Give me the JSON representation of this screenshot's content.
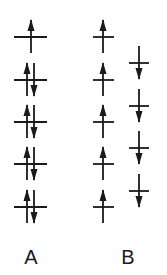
{
  "diagram": {
    "type": "electron-spin-configuration",
    "colors": {
      "line": "#1a1a1a",
      "background": "#ffffff"
    },
    "configurations": [
      {
        "label": "A",
        "description": "paired spins (low spin)",
        "levels": [
          {
            "y": 37,
            "electrons": [
              "up"
            ]
          },
          {
            "y": 80,
            "electrons": [
              "up",
              "down"
            ]
          },
          {
            "y": 122,
            "electrons": [
              "up",
              "down"
            ]
          },
          {
            "y": 164,
            "electrons": [
              "up",
              "down"
            ]
          },
          {
            "y": 207,
            "electrons": [
              "up",
              "down"
            ]
          }
        ]
      },
      {
        "label": "B",
        "description": "unpaired spins (high spin)",
        "columns": [
          {
            "levels": [
              {
                "y": 37,
                "electrons": [
                  "up"
                ]
              },
              {
                "y": 80,
                "electrons": [
                  "up"
                ]
              },
              {
                "y": 122,
                "electrons": [
                  "up"
                ]
              },
              {
                "y": 164,
                "electrons": [
                  "up"
                ]
              },
              {
                "y": 207,
                "electrons": [
                  "up"
                ]
              }
            ]
          },
          {
            "levels": [
              {
                "y": 63,
                "electrons": [
                  "down"
                ]
              },
              {
                "y": 106,
                "electrons": [
                  "down"
                ]
              },
              {
                "y": 148,
                "electrons": [
                  "down"
                ]
              },
              {
                "y": 191,
                "electrons": [
                  "down"
                ]
              }
            ]
          }
        ]
      }
    ]
  },
  "labels": {
    "a": "A",
    "b": "B"
  }
}
